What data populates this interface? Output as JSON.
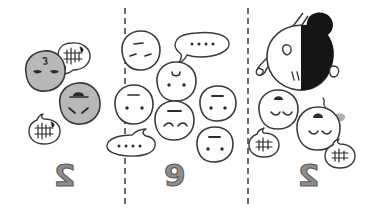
{
  "figure": {
    "title": "Three-panel hand-drawn comic of round faces with speech bubbles",
    "background_color": "#ffffff",
    "ink_color": "#3a3a3a",
    "gray_fill": "#b8b8b8",
    "white_fill": "#fdfdfd",
    "black_fill": "#151515",
    "divider_style": "vertical dashed line",
    "divider_color": "#6b6b6b"
  },
  "panels": [
    {
      "number_label": "2",
      "name": "panel-left",
      "description": "Two gray round faces and two small speech bubbles with scribbles",
      "faces": [
        {
          "name": "gray-face-upper",
          "fill": "#b8b8b8",
          "expression": "neutral-flat-eyes",
          "top_mark": "squiggle-tuft"
        },
        {
          "name": "gray-face-lower",
          "fill": "#b8b8b8",
          "expression": "frowning-slanted-eyes",
          "top_mark": "arch-cap"
        }
      ],
      "bubbles": [
        {
          "name": "scribble-bubble-upper",
          "content": "scribble",
          "tail": "down-left"
        },
        {
          "name": "scribble-bubble-lower",
          "content": "scribble",
          "tail": "up-right"
        }
      ]
    },
    {
      "number_label": "9",
      "name": "panel-middle",
      "description": "Six white round faces and two speech bubbles containing four dots each",
      "faces": [
        {
          "name": "white-face-1",
          "fill": "#fdfdfd",
          "expression": "three-marks"
        },
        {
          "name": "white-face-2",
          "fill": "#fdfdfd",
          "expression": "dot-eyes-arch"
        },
        {
          "name": "white-face-3",
          "fill": "#fdfdfd",
          "expression": "dot-eyes"
        },
        {
          "name": "white-face-4",
          "fill": "#fdfdfd",
          "expression": "smiling-dot-eyes"
        },
        {
          "name": "white-face-5",
          "fill": "#fdfdfd",
          "expression": "dot-eyes"
        },
        {
          "name": "white-face-6",
          "fill": "#fdfdfd",
          "expression": "dot-eyes"
        }
      ],
      "bubbles": [
        {
          "name": "ellipsis-bubble-upper",
          "content": "....",
          "dot_count": 4,
          "tail": "down-left"
        },
        {
          "name": "ellipsis-bubble-lower",
          "content": "....",
          "dot_count": 4,
          "tail": "up-right"
        }
      ]
    },
    {
      "number_label": "2",
      "name": "panel-right",
      "description": "Profile head with black hair bun holding a pointed stick, two white faces with closed eyes, two small scribble bubbles, a squiggle and a gray blob",
      "figure_head": {
        "name": "profile-head-with-bun",
        "hair_fill": "#151515",
        "face_fill": "#fdfdfd",
        "accessory": "pointed-stick"
      },
      "faces": [
        {
          "name": "white-face-left",
          "fill": "#fdfdfd",
          "expression": "closed-eyes-arch"
        },
        {
          "name": "white-face-right",
          "fill": "#fdfdfd",
          "expression": "closed-eyes-arch"
        }
      ],
      "bubbles": [
        {
          "name": "scribble-bubble-left",
          "content": "scribble",
          "tail": "up-right"
        },
        {
          "name": "scribble-bubble-right",
          "content": "scribble",
          "tail": "up-left"
        }
      ],
      "marks": [
        {
          "name": "squiggle-mark",
          "kind": "wavy-line"
        },
        {
          "name": "gray-blob",
          "kind": "smudge",
          "fill": "#b0b0b0"
        }
      ]
    }
  ]
}
